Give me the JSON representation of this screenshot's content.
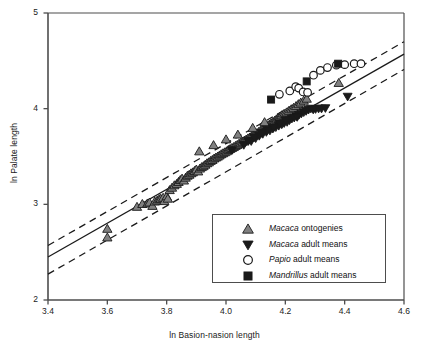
{
  "chart_data": {
    "type": "scatter",
    "title": "",
    "xlabel": "ln Basion-nasion length",
    "ylabel": "ln Palate length",
    "xlim": [
      3.4,
      4.6
    ],
    "ylim": [
      2,
      5
    ],
    "xticks": [
      "3.4",
      "3.6",
      "3.8",
      "4.0",
      "4.2",
      "4.4",
      "4.6"
    ],
    "xtick_values": [
      3.4,
      3.6,
      3.8,
      4.0,
      4.2,
      4.4,
      4.6
    ],
    "yticks": [
      "2",
      "3",
      "4",
      "5"
    ],
    "ytick_values": [
      2,
      3,
      4,
      5
    ],
    "grid": false,
    "legend_position": "lower-right-inside",
    "fit_lines": [
      {
        "name": "regression-line",
        "style": "solid",
        "color": "#1a1a1a",
        "x": [
          3.4,
          4.6
        ],
        "y": [
          2.45,
          4.57
        ]
      },
      {
        "name": "upper-confidence-band",
        "style": "dashed",
        "color": "#1a1a1a",
        "x": [
          3.4,
          4.6
        ],
        "y": [
          2.57,
          4.7
        ]
      },
      {
        "name": "lower-confidence-band",
        "style": "dashed",
        "color": "#1a1a1a",
        "x": [
          3.4,
          4.6
        ],
        "y": [
          2.27,
          4.41
        ]
      }
    ],
    "series": [
      {
        "name": "Macaca ontogenies",
        "marker": "triangle-up",
        "color": "#808080",
        "edge": "#1a1a1a",
        "points": [
          [
            3.6,
            2.745
          ],
          [
            3.6,
            2.655
          ],
          [
            3.7,
            2.975
          ],
          [
            3.718,
            3.005
          ],
          [
            3.735,
            3.01
          ],
          [
            3.742,
            3.02
          ],
          [
            3.752,
            2.985
          ],
          [
            3.76,
            3.03
          ],
          [
            3.768,
            3.04
          ],
          [
            3.775,
            3.055
          ],
          [
            3.78,
            3.06
          ],
          [
            3.788,
            3.07
          ],
          [
            3.792,
            3.035
          ],
          [
            3.8,
            3.085
          ],
          [
            3.804,
            3.06
          ],
          [
            3.81,
            3.15
          ],
          [
            3.818,
            3.175
          ],
          [
            3.826,
            3.2
          ],
          [
            3.834,
            3.215
          ],
          [
            3.84,
            3.235
          ],
          [
            3.846,
            3.255
          ],
          [
            3.852,
            3.27
          ],
          [
            3.858,
            3.25
          ],
          [
            3.864,
            3.28
          ],
          [
            3.87,
            3.3
          ],
          [
            3.876,
            3.31
          ],
          [
            3.882,
            3.325
          ],
          [
            3.888,
            3.335
          ],
          [
            3.894,
            3.35
          ],
          [
            3.9,
            3.365
          ],
          [
            3.906,
            3.345
          ],
          [
            3.912,
            3.375
          ],
          [
            3.918,
            3.39
          ],
          [
            3.924,
            3.4
          ],
          [
            3.93,
            3.415
          ],
          [
            3.936,
            3.43
          ],
          [
            3.942,
            3.44
          ],
          [
            3.948,
            3.455
          ],
          [
            3.954,
            3.465
          ],
          [
            3.96,
            3.48
          ],
          [
            3.966,
            3.49
          ],
          [
            3.972,
            3.5
          ],
          [
            3.978,
            3.512
          ],
          [
            3.984,
            3.525
          ],
          [
            3.99,
            3.535
          ],
          [
            3.996,
            3.545
          ],
          [
            4.002,
            3.555
          ],
          [
            4.008,
            3.57
          ],
          [
            4.014,
            3.58
          ],
          [
            4.02,
            3.59
          ],
          [
            4.026,
            3.6
          ],
          [
            4.032,
            3.612
          ],
          [
            4.038,
            3.622
          ],
          [
            4.044,
            3.635
          ],
          [
            4.05,
            3.645
          ],
          [
            4.056,
            3.655
          ],
          [
            4.062,
            3.668
          ],
          [
            4.068,
            3.678
          ],
          [
            4.074,
            3.69
          ],
          [
            4.08,
            3.7
          ],
          [
            4.086,
            3.712
          ],
          [
            4.092,
            3.722
          ],
          [
            4.098,
            3.735
          ],
          [
            4.104,
            3.745
          ],
          [
            4.11,
            3.758
          ],
          [
            4.116,
            3.77
          ],
          [
            4.122,
            3.782
          ],
          [
            4.128,
            3.795
          ],
          [
            4.134,
            3.808
          ],
          [
            4.14,
            3.82
          ],
          [
            4.146,
            3.835
          ],
          [
            4.152,
            3.848
          ],
          [
            4.158,
            3.862
          ],
          [
            4.164,
            3.875
          ],
          [
            4.17,
            3.89
          ],
          [
            4.176,
            3.905
          ],
          [
            4.182,
            3.918
          ],
          [
            4.188,
            3.932
          ],
          [
            4.196,
            3.948
          ],
          [
            4.204,
            3.962
          ],
          [
            4.212,
            3.978
          ],
          [
            4.22,
            3.995
          ],
          [
            4.228,
            4.01
          ],
          [
            4.236,
            4.028
          ],
          [
            4.244,
            4.048
          ],
          [
            4.252,
            4.065
          ],
          [
            4.262,
            4.085
          ],
          [
            4.272,
            4.105
          ],
          [
            3.91,
            3.555
          ],
          [
            3.958,
            3.62
          ],
          [
            4.0,
            3.68
          ],
          [
            4.04,
            3.73
          ],
          [
            4.09,
            3.8
          ],
          [
            4.13,
            3.86
          ],
          [
            4.38,
            4.27
          ]
        ]
      },
      {
        "name": "Macaca adult means",
        "marker": "triangle-down",
        "color": "#1a1a1a",
        "edge": "#1a1a1a",
        "points": [
          [
            4.02,
            3.565
          ],
          [
            4.06,
            3.62
          ],
          [
            4.085,
            3.66
          ],
          [
            4.1,
            3.69
          ],
          [
            4.112,
            3.715
          ],
          [
            4.124,
            3.735
          ],
          [
            4.136,
            3.755
          ],
          [
            4.148,
            3.77
          ],
          [
            4.158,
            3.79
          ],
          [
            4.168,
            3.805
          ],
          [
            4.178,
            3.82
          ],
          [
            4.188,
            3.835
          ],
          [
            4.196,
            3.848
          ],
          [
            4.206,
            3.86
          ],
          [
            4.214,
            3.878
          ],
          [
            4.222,
            3.895
          ],
          [
            4.23,
            3.905
          ],
          [
            4.238,
            3.92
          ],
          [
            4.246,
            3.935
          ],
          [
            4.254,
            3.948
          ],
          [
            4.262,
            3.962
          ],
          [
            4.27,
            3.975
          ],
          [
            4.278,
            3.988
          ],
          [
            4.286,
            4.0
          ],
          [
            4.294,
            3.99
          ],
          [
            4.302,
            3.995
          ],
          [
            4.312,
            4.0
          ],
          [
            4.322,
            4.0
          ],
          [
            4.335,
            4.005
          ],
          [
            4.41,
            4.125
          ],
          [
            4.2,
            3.88
          ],
          [
            4.24,
            3.912
          ],
          [
            4.18,
            3.845
          ],
          [
            4.16,
            3.8
          ],
          [
            4.14,
            3.775
          ],
          [
            4.12,
            3.745
          ],
          [
            4.095,
            3.7
          ],
          [
            4.075,
            3.66
          ]
        ]
      },
      {
        "name": "Papio adult means",
        "marker": "circle-open",
        "color": "#ffffff",
        "edge": "#1a1a1a",
        "points": [
          [
            4.18,
            4.15
          ],
          [
            4.215,
            4.185
          ],
          [
            4.235,
            4.23
          ],
          [
            4.245,
            4.215
          ],
          [
            4.26,
            4.175
          ],
          [
            4.295,
            4.35
          ],
          [
            4.318,
            4.4
          ],
          [
            4.342,
            4.43
          ],
          [
            4.372,
            4.455
          ],
          [
            4.4,
            4.46
          ],
          [
            4.432,
            4.47
          ],
          [
            4.455,
            4.47
          ],
          [
            4.275,
            4.17
          ]
        ]
      },
      {
        "name": "Mandrillus adult means",
        "marker": "square",
        "color": "#1a1a1a",
        "edge": "#1a1a1a",
        "points": [
          [
            4.152,
            4.095
          ],
          [
            4.272,
            4.285
          ],
          [
            4.378,
            4.47
          ]
        ]
      }
    ]
  },
  "legend": {
    "entries": [
      {
        "genus": "Macaca",
        "rest": " ontogenies",
        "marker": "triangle-up"
      },
      {
        "genus": "Macaca",
        "rest": " adult means",
        "marker": "triangle-down"
      },
      {
        "genus": "Papio",
        "rest": " adult means",
        "marker": "circle-open"
      },
      {
        "genus": "Mandrillus",
        "rest": " adult means",
        "marker": "square"
      }
    ]
  },
  "colors": {
    "axis": "#4d4d4d",
    "text": "#1a1a1a",
    "ontogeny_fill": "#808080",
    "adult_fill": "#1a1a1a",
    "background": "#ffffff"
  }
}
